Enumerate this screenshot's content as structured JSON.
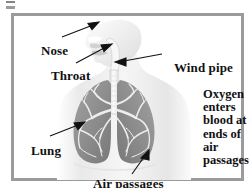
{
  "figure": {
    "style": "grayscale line-and-wash anatomical illustration inside a gray rectangular frame",
    "colors": {
      "page_background": "#ffffff",
      "frame_border": "#9b9b9b",
      "body_fill": "#efefef",
      "body_shade": "#d8d8d8",
      "lung_fill": "#8e8e8e",
      "lung_shade": "#6f6f6f",
      "airway_fill": "#f4f4f4",
      "branch_stroke": "#e8e8e8",
      "text": "#111111",
      "leader_line": "#111111"
    }
  },
  "labels": {
    "nose": "Nose",
    "throat": "Throat",
    "wind_pipe": "Wind pipe",
    "lung": "Lung",
    "air_passages": "Air passages"
  },
  "callout": {
    "lines": [
      "Oxygen",
      "enters",
      "blood at",
      "ends of",
      "air",
      "passages"
    ],
    "full_text": "Oxygen enters blood at ends of air passages"
  },
  "annotations": {
    "nose_arrow": "arrow pointing up-right from the word Nose to the nose on the head profile",
    "throat_arrow": "arrow pointing up-right from the word Throat to the throat / pharynx",
    "wind_pipe_arrow": "arrow pointing left from the words Wind pipe to the trachea",
    "lung_arrow": "arrow pointing right from the word Lung to the left lung",
    "air_passages_arrow": "arrow pointing up-right from the words Air passages to the bronchial branches in the right lung"
  }
}
